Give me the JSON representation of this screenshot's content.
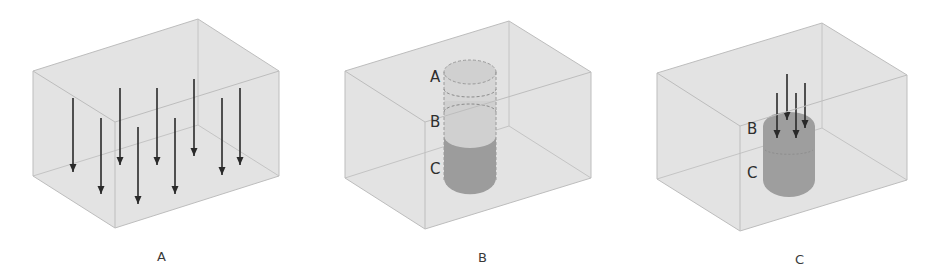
{
  "figure": {
    "panels": [
      {
        "id": "A",
        "caption": "A",
        "content": "box with uniform downward arrows",
        "arrow_count": 9
      },
      {
        "id": "B",
        "caption": "B",
        "content": "box with vertical cylinder divided into three stacked zones",
        "zone_labels": [
          "A",
          "B",
          "C"
        ]
      },
      {
        "id": "C",
        "caption": "C",
        "content": "box with darkened cylinder and concentrated downward arrows",
        "zone_labels": [
          "B",
          "C"
        ],
        "arrow_count": 4
      }
    ],
    "colors": {
      "box_fill": "#e2e2e2",
      "box_edge": "#bdbdbd",
      "cylinder_light": "#cfcfcf",
      "cylinder_dark": "#9a9a9a",
      "arrow": "#2a2a2a"
    }
  }
}
